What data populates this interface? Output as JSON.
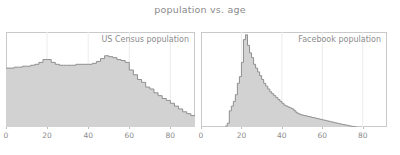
{
  "chart_data": {
    "type": "bar",
    "title": "population vs. age",
    "xlabel": "",
    "ylabel": "",
    "grid": true,
    "legend_position": "inside-top-right",
    "xlim": [
      0,
      92
    ],
    "xticks": [
      0,
      20,
      40,
      60,
      80
    ],
    "colors": {
      "fill": "#d2d2d2",
      "edge": "#8f8f8f",
      "frame": "#c9c9c9",
      "grid": "#ececec",
      "text": "#8c8c8c",
      "title": "#8a8a8a",
      "background": "#ffffff"
    },
    "panels": [
      {
        "label": "US Census population",
        "bin_width": 2,
        "x": [
          0,
          2,
          4,
          6,
          8,
          10,
          12,
          14,
          16,
          18,
          20,
          22,
          24,
          26,
          28,
          30,
          32,
          34,
          36,
          38,
          40,
          42,
          44,
          46,
          48,
          50,
          52,
          54,
          56,
          58,
          60,
          62,
          64,
          66,
          68,
          70,
          72,
          74,
          76,
          78,
          80,
          82,
          84,
          86,
          88,
          90
        ],
        "values": [
          0.62,
          0.62,
          0.63,
          0.63,
          0.64,
          0.64,
          0.65,
          0.66,
          0.68,
          0.71,
          0.71,
          0.68,
          0.66,
          0.65,
          0.65,
          0.65,
          0.65,
          0.66,
          0.66,
          0.66,
          0.66,
          0.67,
          0.69,
          0.72,
          0.75,
          0.74,
          0.73,
          0.71,
          0.7,
          0.68,
          0.6,
          0.55,
          0.5,
          0.47,
          0.42,
          0.4,
          0.36,
          0.33,
          0.3,
          0.28,
          0.25,
          0.22,
          0.19,
          0.16,
          0.14,
          0.12
        ],
        "ylim": [
          0,
          1.0
        ]
      },
      {
        "label": "Facebook population",
        "bin_width": 1,
        "x": [
          12,
          13,
          14,
          15,
          16,
          17,
          18,
          19,
          20,
          21,
          22,
          23,
          24,
          25,
          26,
          27,
          28,
          29,
          30,
          31,
          32,
          33,
          34,
          35,
          36,
          37,
          38,
          39,
          40,
          41,
          42,
          43,
          44,
          45,
          46,
          47,
          48,
          49,
          50,
          51,
          52,
          53,
          54,
          55,
          56,
          57,
          58,
          59,
          60,
          61,
          62,
          63,
          64,
          65,
          66,
          67,
          68,
          69,
          70,
          71,
          72,
          73,
          74,
          75,
          76
        ],
        "values": [
          0.01,
          0.04,
          0.17,
          0.22,
          0.27,
          0.34,
          0.46,
          0.53,
          0.68,
          0.92,
          0.97,
          0.86,
          0.78,
          0.73,
          0.66,
          0.62,
          0.58,
          0.54,
          0.5,
          0.46,
          0.43,
          0.4,
          0.37,
          0.35,
          0.33,
          0.31,
          0.29,
          0.27,
          0.25,
          0.23,
          0.22,
          0.21,
          0.2,
          0.19,
          0.17,
          0.15,
          0.14,
          0.13,
          0.125,
          0.12,
          0.115,
          0.11,
          0.105,
          0.1,
          0.095,
          0.09,
          0.085,
          0.08,
          0.075,
          0.07,
          0.065,
          0.06,
          0.055,
          0.05,
          0.045,
          0.04,
          0.035,
          0.03,
          0.026,
          0.022,
          0.018,
          0.013,
          0.008,
          0.004,
          0.001
        ],
        "ylim": [
          0,
          1.0
        ]
      }
    ]
  }
}
